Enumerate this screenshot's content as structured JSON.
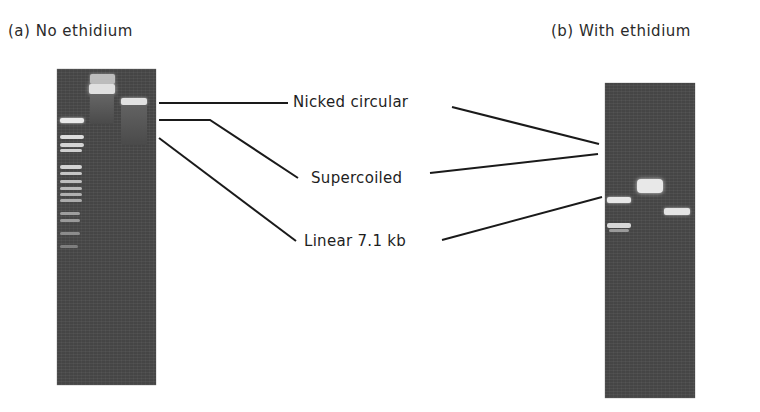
{
  "panels": [
    {
      "id": "a",
      "title": "(a) No ethidium",
      "lanes": [
        {
          "name": "ladder",
          "bands": [
            0.16,
            0.21,
            0.24,
            0.3,
            0.32,
            0.35,
            0.4,
            0.43,
            0.46,
            0.48,
            0.53,
            0.55,
            0.6,
            0.64
          ]
        },
        {
          "name": "plasmid-uncut",
          "bands": [
            0.04,
            0.09
          ]
        },
        {
          "name": "plasmid-linear",
          "bands": [
            0.12
          ]
        }
      ]
    },
    {
      "id": "b",
      "title": "(b) With ethidium",
      "lanes": [
        {
          "name": "plasmid-uncut",
          "bands": [
            0.39,
            0.49
          ]
        },
        {
          "name": "plasmid-cut",
          "bands": [
            0.27
          ]
        },
        {
          "name": "plasmid-linear",
          "bands": [
            0.34
          ]
        }
      ]
    }
  ],
  "labels": {
    "nicked": "Nicked circular",
    "supercoiled": "Supercoiled",
    "linear": "Linear 7.1 kb"
  },
  "colors": {
    "gel": "#4a4a4a",
    "band": "#e8e8e8",
    "line": "#1a1a1a"
  }
}
